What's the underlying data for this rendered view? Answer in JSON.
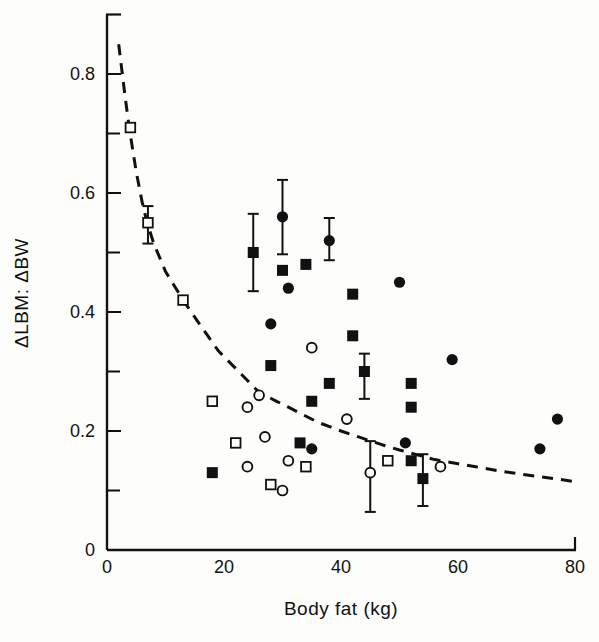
{
  "colors": {
    "ink": "#111111",
    "paper": "#fdfdfb"
  },
  "chart_data": {
    "type": "scatter",
    "title": "",
    "xlabel": "Body fat (kg)",
    "ylabel": "ΔLBM: ΔBW",
    "xlim": [
      0,
      80
    ],
    "ylim": [
      0,
      0.9
    ],
    "grid": false,
    "legend": "none",
    "x_ticks": [
      {
        "v": 0,
        "label": "0"
      },
      {
        "v": 20,
        "label": "20"
      },
      {
        "v": 40,
        "label": "40"
      },
      {
        "v": 60,
        "label": "60"
      },
      {
        "v": 80,
        "label": "80"
      }
    ],
    "y_major_ticks": [
      {
        "v": 0,
        "label": "0"
      },
      {
        "v": 0.2,
        "label": "0.2"
      },
      {
        "v": 0.4,
        "label": "0.4"
      },
      {
        "v": 0.6,
        "label": "0.6"
      },
      {
        "v": 0.8,
        "label": "0.8"
      }
    ],
    "y_minor_ticks": [
      0.1,
      0.3,
      0.5,
      0.7
    ],
    "series": [
      {
        "name": "open-square",
        "marker": "square-open",
        "points": [
          [
            4,
            0.71
          ],
          [
            7,
            0.55
          ],
          [
            13,
            0.42
          ],
          [
            18,
            0.25
          ],
          [
            22,
            0.18
          ],
          [
            28,
            0.11
          ],
          [
            34,
            0.14
          ],
          [
            48,
            0.15
          ]
        ]
      },
      {
        "name": "open-circle",
        "marker": "circle-open",
        "points": [
          [
            24,
            0.14
          ],
          [
            24,
            0.24
          ],
          [
            26,
            0.26
          ],
          [
            27,
            0.19
          ],
          [
            30,
            0.1
          ],
          [
            31,
            0.15
          ],
          [
            35,
            0.34
          ],
          [
            41,
            0.22
          ],
          [
            45,
            0.13
          ],
          [
            57,
            0.14
          ]
        ]
      },
      {
        "name": "filled-circle",
        "marker": "circle-filled",
        "points": [
          [
            28,
            0.38
          ],
          [
            30,
            0.56
          ],
          [
            31,
            0.44
          ],
          [
            35,
            0.17
          ],
          [
            38,
            0.52
          ],
          [
            50,
            0.45
          ],
          [
            51,
            0.18
          ],
          [
            59,
            0.32
          ],
          [
            74,
            0.17
          ],
          [
            77,
            0.22
          ]
        ]
      },
      {
        "name": "filled-square",
        "marker": "square-filled",
        "points": [
          [
            18,
            0.13
          ],
          [
            25,
            0.5
          ],
          [
            28,
            0.31
          ],
          [
            30,
            0.47
          ],
          [
            33,
            0.18
          ],
          [
            34,
            0.48
          ],
          [
            35,
            0.25
          ],
          [
            38,
            0.28
          ],
          [
            42,
            0.36
          ],
          [
            42,
            0.43
          ],
          [
            44,
            0.3
          ],
          [
            52,
            0.15
          ],
          [
            52,
            0.24
          ],
          [
            52,
            0.28
          ],
          [
            54,
            0.12
          ]
        ]
      }
    ],
    "error_bars": [
      {
        "x": 7,
        "y": 0.55,
        "lo": 0.515,
        "hi": 0.578,
        "series": "open-square"
      },
      {
        "x": 25,
        "y": 0.5,
        "lo": 0.435,
        "hi": 0.565,
        "series": "filled-square"
      },
      {
        "x": 30,
        "y": 0.56,
        "lo": 0.497,
        "hi": 0.622,
        "series": "filled-circle"
      },
      {
        "x": 38,
        "y": 0.52,
        "lo": 0.487,
        "hi": 0.558,
        "series": "filled-circle"
      },
      {
        "x": 44,
        "y": 0.3,
        "lo": 0.254,
        "hi": 0.33,
        "series": "filled-square"
      },
      {
        "x": 45,
        "y": 0.13,
        "lo": 0.064,
        "hi": 0.183,
        "series": "open-circle"
      },
      {
        "x": 54,
        "y": 0.12,
        "lo": 0.074,
        "hi": 0.161,
        "series": "filled-square"
      }
    ],
    "curve": {
      "style": "dashed",
      "points": [
        [
          2,
          0.85
        ],
        [
          3,
          0.77
        ],
        [
          3.8,
          0.71
        ],
        [
          5,
          0.635
        ],
        [
          6,
          0.585
        ],
        [
          6.8,
          0.552
        ],
        [
          8,
          0.515
        ],
        [
          10,
          0.468
        ],
        [
          13,
          0.42
        ],
        [
          16,
          0.377
        ],
        [
          19,
          0.335
        ],
        [
          23,
          0.295
        ],
        [
          26,
          0.265
        ],
        [
          29,
          0.25
        ],
        [
          31,
          0.24
        ],
        [
          36,
          0.215
        ],
        [
          40,
          0.2
        ],
        [
          43,
          0.19
        ],
        [
          47,
          0.177
        ],
        [
          50,
          0.168
        ],
        [
          56,
          0.152
        ],
        [
          60,
          0.145
        ],
        [
          63,
          0.14
        ],
        [
          67,
          0.133
        ],
        [
          71,
          0.127
        ],
        [
          75,
          0.122
        ],
        [
          80,
          0.115
        ]
      ]
    }
  }
}
